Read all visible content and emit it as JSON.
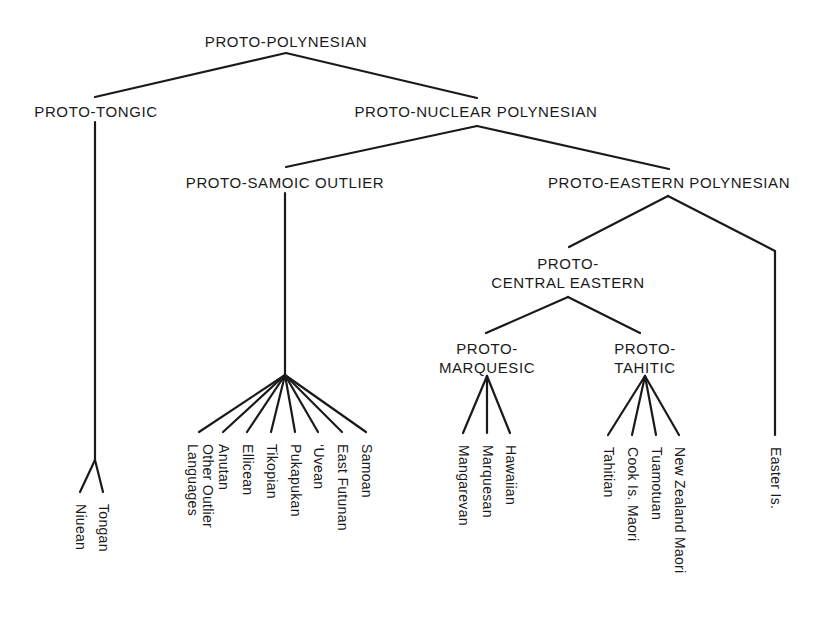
{
  "diagram": {
    "type": "language-family-tree",
    "line_color": "#1a1a1a",
    "root": "PROTO-POLYNESIAN",
    "nodes": [
      {
        "id": "pp",
        "label": "PROTO-POLYNESIAN",
        "x": 286,
        "y": 32,
        "apex": [
          286,
          53
        ]
      },
      {
        "id": "pt",
        "label": "PROTO-TONGIC",
        "x": 96,
        "y": 102,
        "attach": [
          95,
          97
        ],
        "apex": [
          95,
          122
        ]
      },
      {
        "id": "pnp",
        "label": "PROTO-NUCLEAR POLYNESIAN",
        "x": 476,
        "y": 102,
        "attach": [
          477,
          98
        ],
        "apex": [
          477,
          126
        ]
      },
      {
        "id": "pso",
        "label": "PROTO-SAMOIC OUTLIER",
        "x": 285,
        "y": 173,
        "attach": [
          286,
          167
        ],
        "apex": [
          285,
          193
        ]
      },
      {
        "id": "pep",
        "label": "PROTO-EASTERN POLYNESIAN",
        "x": 669,
        "y": 173,
        "attach": [
          669,
          169
        ],
        "apex": [
          668,
          196
        ]
      },
      {
        "id": "pce",
        "label": "PROTO-\nCENTRAL EASTERN",
        "line1": "PROTO-",
        "line2": "CENTRAL EASTERN",
        "x": 568,
        "y": 254,
        "attach": [
          569,
          247
        ],
        "apex": [
          568,
          297
        ]
      },
      {
        "id": "pm",
        "label": "PROTO-\nMARQUESIC",
        "line1": "PROTO-",
        "line2": "MARQUESIC",
        "x": 487,
        "y": 339,
        "attach": [
          486,
          333
        ],
        "apex": [
          487,
          376
        ]
      },
      {
        "id": "pth",
        "label": "PROTO-\nTAHITIC",
        "line1": "PROTO-",
        "line2": "TAHITIC",
        "x": 645,
        "y": 339,
        "attach": [
          640,
          333
        ],
        "apex": [
          645,
          376
        ]
      }
    ],
    "edges": [
      {
        "from": "pp",
        "to": "pt"
      },
      {
        "from": "pp",
        "to": "pnp"
      },
      {
        "from": "pnp",
        "to": "pso"
      },
      {
        "from": "pnp",
        "to": "pep"
      },
      {
        "from": "pep",
        "to": "pce"
      },
      {
        "from": "pce",
        "to": "pm"
      },
      {
        "from": "pce",
        "to": "pth"
      }
    ],
    "labels": {
      "proto_polynesian": "PROTO-POLYNESIAN",
      "proto_tongic": "PROTO-TONGIC",
      "proto_nuclear_polynesian": "PROTO-NUCLEAR POLYNESIAN",
      "proto_samoic_outlier": "PROTO-SAMOIC OUTLIER",
      "proto_eastern_polynesian": "PROTO-EASTERN POLYNESIAN",
      "proto_central_eastern_1": "PROTO-",
      "proto_central_eastern_2": "CENTRAL EASTERN",
      "proto_marquesic_1": "PROTO-",
      "proto_marquesic_2": "MARQUESIC",
      "proto_tahitic_1": "PROTO-",
      "proto_tahitic_2": "TAHITIC"
    },
    "groups": {
      "tongic": {
        "parent": "PROTO-TONGIC",
        "stem": [
          [
            95,
            122
          ],
          [
            95,
            460
          ]
        ],
        "fork": [
          95,
          460
        ],
        "leaves": [
          {
            "name": "Niuean",
            "x": 80,
            "y": 492
          },
          {
            "name": "Tongan",
            "x": 103,
            "y": 492
          }
        ]
      },
      "samoic_outlier": {
        "parent": "PROTO-SAMOIC OUTLIER",
        "stem": [
          [
            285,
            193
          ],
          [
            285,
            375
          ]
        ],
        "fork": [
          285,
          375
        ],
        "leaves": [
          {
            "name": "Other Outlier\nLanguages",
            "line1": "Other Outlier",
            "line2": "Languages",
            "x": 199,
            "y": 432
          },
          {
            "name": "Anutan",
            "x": 223,
            "y": 432
          },
          {
            "name": "Ellicean",
            "x": 247,
            "y": 432
          },
          {
            "name": "Tikopian",
            "x": 271,
            "y": 432
          },
          {
            "name": "Pukapukan",
            "x": 295,
            "y": 432
          },
          {
            "name": "‘Uvean",
            "x": 318,
            "y": 432
          },
          {
            "name": "East Futunan",
            "x": 342,
            "y": 432
          },
          {
            "name": "Samoan",
            "x": 366,
            "y": 432
          }
        ]
      },
      "marquesic": {
        "parent": "PROTO-MARQUESIC",
        "fork": [
          487,
          376
        ],
        "leaves": [
          {
            "name": "Mangarevan",
            "x": 463,
            "y": 433
          },
          {
            "name": "Marquesan",
            "x": 487,
            "y": 433
          },
          {
            "name": "Hawaiian",
            "x": 510,
            "y": 433
          }
        ]
      },
      "tahitic": {
        "parent": "PROTO-TAHITIC",
        "fork": [
          645,
          376
        ],
        "leaves": [
          {
            "name": "Tahitian",
            "x": 608,
            "y": 435
          },
          {
            "name": "Cook Is. Maori",
            "x": 632,
            "y": 435
          },
          {
            "name": "Tuamotuan",
            "x": 656,
            "y": 435
          },
          {
            "name": "New Zealand Maori",
            "x": 679,
            "y": 435
          }
        ]
      },
      "easter": {
        "parent": "PROTO-EASTERN POLYNESIAN",
        "path": [
          [
            668,
            196
          ],
          [
            775,
            251
          ],
          [
            775,
            435
          ]
        ],
        "leaves": [
          {
            "name": "Easter Is.",
            "x": 775,
            "y": 435
          }
        ]
      }
    }
  }
}
